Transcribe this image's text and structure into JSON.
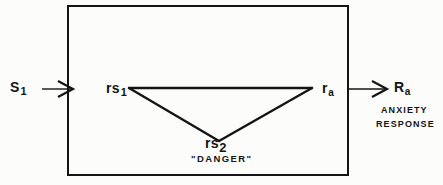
{
  "figure": {
    "type": "block-diagram",
    "background_color": "#fcfcfa",
    "line_color": "#141414",
    "box": {
      "name": "mediating-process-box",
      "x": 67,
      "y": 5,
      "width": 281,
      "height": 170,
      "stroke_width": 2
    },
    "input": {
      "label_main": "S",
      "label_sub": "1",
      "arrow_from_x": 42,
      "arrow_to_x": 70,
      "arrow_y": 89
    },
    "output": {
      "label_main": "R",
      "label_sub": "a",
      "arrow_from_x": 348,
      "arrow_to_x": 388,
      "arrow_y": 89,
      "caption_line_1": "ANXIETY",
      "caption_line_2": "RESPONSE"
    },
    "nodes": [
      {
        "id": "rs1",
        "label_main": "rs",
        "label_sub": "1",
        "x": 128,
        "y": 88
      },
      {
        "id": "ra",
        "label_main": "r",
        "label_sub": "a",
        "x": 312,
        "y": 88
      },
      {
        "id": "rs2",
        "label_main": "rs",
        "label_sub": "2",
        "x": 218,
        "y": 140,
        "annotation": "\"DANGER\""
      }
    ],
    "links": [
      {
        "name": "rs1-to-ra",
        "from": "rs1",
        "to": "ra"
      },
      {
        "name": "rs1-to-rs2",
        "from": "rs1",
        "to": "rs2"
      },
      {
        "name": "rs2-to-ra",
        "from": "rs2",
        "to": "ra"
      }
    ]
  }
}
